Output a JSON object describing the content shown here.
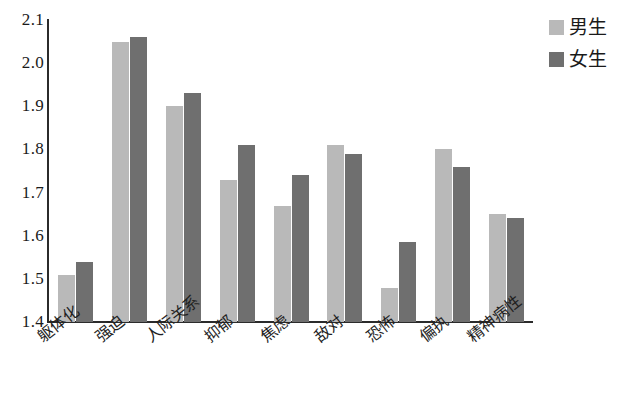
{
  "chart_data": {
    "type": "bar",
    "title": "",
    "subtitle": "",
    "xlabel": "",
    "ylabel": "",
    "ylim": [
      1.4,
      2.1
    ],
    "ytick_step": 0.1,
    "ytick_labels": [
      "2.1",
      "2.0",
      "1.9",
      "1.8",
      "1.7",
      "1.6",
      "1.5",
      "1.4"
    ],
    "ytick_values": [
      2.1,
      2.0,
      1.9,
      1.8,
      1.7,
      1.6,
      1.5,
      1.4
    ],
    "grid": false,
    "legend_position": "top-right",
    "categories": [
      "躯体化",
      "强迫",
      "人际关系",
      "抑郁",
      "焦虑",
      "敌对",
      "恐怖",
      "偏执",
      "精神病性"
    ],
    "series": [
      {
        "name": "男生",
        "color": "#b9b9b9",
        "values": [
          1.51,
          2.05,
          1.9,
          1.73,
          1.67,
          1.81,
          1.48,
          1.8,
          1.65
        ]
      },
      {
        "name": "女生",
        "color": "#6f6f6f",
        "values": [
          1.54,
          2.06,
          1.93,
          1.81,
          1.74,
          1.79,
          1.585,
          1.76,
          1.64
        ]
      }
    ]
  },
  "legend": {
    "items": [
      {
        "label": "男生",
        "swatch": "male"
      },
      {
        "label": "女生",
        "swatch": "female"
      }
    ]
  },
  "axis": {
    "y_line_color": "#2b2b2b",
    "x_line_color": "#2b2b2b"
  }
}
